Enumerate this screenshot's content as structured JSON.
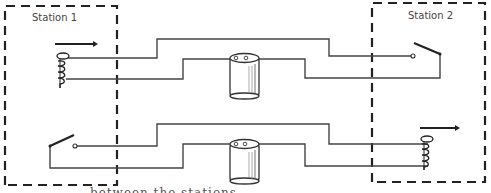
{
  "diagram": {
    "stations": [
      {
        "label": "Station 1",
        "components": [
          "sounder-coil-top",
          "key-switch-bottom"
        ]
      },
      {
        "label": "Station 2",
        "components": [
          "key-switch-top",
          "sounder-coil-bottom"
        ]
      }
    ],
    "circuits": [
      {
        "name": "top-circuit",
        "from": "Station 1 coil",
        "to": "Station 2 switch",
        "battery": "center"
      },
      {
        "name": "bottom-circuit",
        "from": "Station 1 switch",
        "to": "Station 2 coil",
        "battery": "center"
      }
    ],
    "caption": "between the stations",
    "colors": {
      "line": "#333333",
      "dash": "#222222",
      "battery_shade": "#888888"
    }
  }
}
